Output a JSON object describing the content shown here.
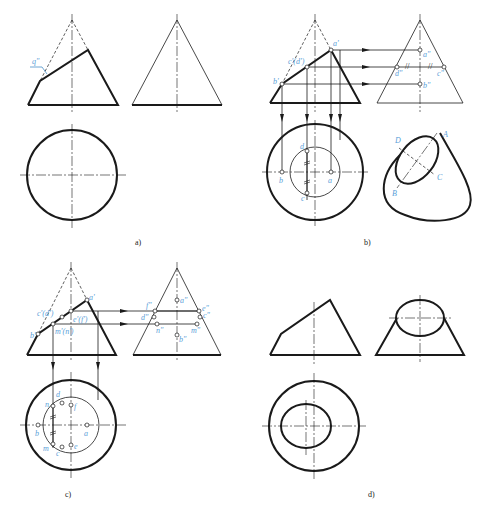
{
  "figure": {
    "captions": {
      "a": "a)",
      "b": "b)",
      "c": "c)",
      "d": "d)"
    },
    "colors": {
      "line": "#1a1a1a",
      "label": "#5aa0d8",
      "background": "#ffffff"
    },
    "panel_a": {
      "labels": {
        "cut_plane": "q\""
      }
    },
    "panel_b": {
      "front_labels": {
        "a": "a'",
        "cd": "c'(d')",
        "b": "b'"
      },
      "side_labels": {
        "a": "a\"",
        "d": "d\"",
        "c": "c\"",
        "b": "b\"",
        "parallel_mark": "//"
      },
      "top_labels": {
        "d": "d",
        "b": "b",
        "a": "a",
        "c": "c"
      },
      "iso_labels": {
        "A": "A",
        "B": "B",
        "C": "C",
        "D": "D"
      }
    },
    "panel_c": {
      "front_labels": {
        "a": "a'",
        "cd": "c'(d')",
        "ef": "e'(f')",
        "b": "b'",
        "mn": "m'(n')"
      },
      "side_labels": {
        "a": "a\"",
        "f": "f\"",
        "e": "e\"",
        "d": "d\"",
        "c": "c\"",
        "n": "n\"",
        "m": "m\"",
        "b": "b\""
      },
      "top_labels": {
        "n": "n",
        "d": "d",
        "f": "f",
        "b": "b",
        "a": "a",
        "m": "m",
        "c": "c",
        "e": "e"
      }
    }
  }
}
